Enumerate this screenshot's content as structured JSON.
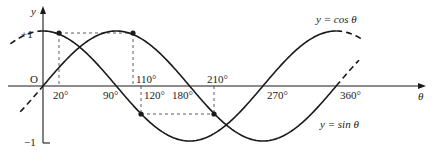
{
  "diagram": {
    "axes": {
      "x_label": "θ",
      "y_label": "y",
      "origin_label": "O",
      "y_ticks": [
        "+1",
        "−1"
      ],
      "x_tick_labels_below": [
        "20°",
        "90°",
        "120°",
        "180°",
        "270°",
        "360°"
      ],
      "x_tick_labels_above": [
        "110°",
        "210°"
      ]
    },
    "curves": {
      "cos_label": "y = cos θ",
      "sin_label": "y = sin θ"
    },
    "marked_points": [
      {
        "theta": 20,
        "value": "cos 20° = sin 110°",
        "level": "upper"
      },
      {
        "theta": 110,
        "value": "sin 110°",
        "level": "upper"
      },
      {
        "theta": 120,
        "value": "cos 120°",
        "level": "lower"
      },
      {
        "theta": 210,
        "value": "sin 210°",
        "level": "lower"
      }
    ],
    "colors": {
      "line": "#1a1a1a",
      "background": "#ffffff"
    }
  }
}
